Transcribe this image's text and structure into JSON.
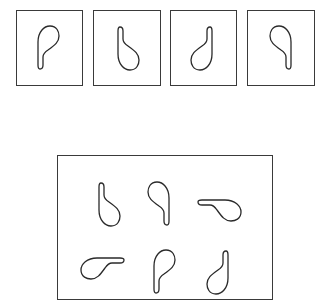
{
  "figure": {
    "type": "mental-rotation-puzzle",
    "reference_boxes": [
      {
        "id": "ref-1",
        "x": 16,
        "y": 10,
        "w": 67,
        "h": 76,
        "shape": {
          "cx": 47,
          "cy": 48,
          "rotate": 0,
          "mirror": false
        }
      },
      {
        "id": "ref-2",
        "x": 93,
        "y": 10,
        "w": 68,
        "h": 76,
        "shape": {
          "cx": 127,
          "cy": 48,
          "rotate": 180,
          "mirror": true
        }
      },
      {
        "id": "ref-3",
        "x": 170,
        "y": 10,
        "w": 67,
        "h": 76,
        "shape": {
          "cx": 203,
          "cy": 48,
          "rotate": 180,
          "mirror": false
        }
      },
      {
        "id": "ref-4",
        "x": 247,
        "y": 10,
        "w": 68,
        "h": 76,
        "shape": {
          "cx": 282,
          "cy": 48,
          "rotate": 0,
          "mirror": true
        }
      }
    ],
    "answer_box": {
      "x": 57,
      "y": 155,
      "w": 216,
      "h": 145
    },
    "answer_shapes": [
      {
        "id": "opt-1",
        "cx": 108,
        "cy": 204,
        "rotate": 180,
        "mirror": true
      },
      {
        "id": "opt-2",
        "cx": 160,
        "cy": 204,
        "rotate": 0,
        "mirror": true
      },
      {
        "id": "opt-3",
        "cx": 219,
        "cy": 209,
        "rotate": 90,
        "mirror": false
      },
      {
        "id": "opt-4",
        "cx": 103,
        "cy": 267,
        "rotate": 270,
        "mirror": true
      },
      {
        "id": "opt-5",
        "cx": 163,
        "cy": 272,
        "rotate": 0,
        "mirror": false
      },
      {
        "id": "opt-6",
        "cx": 219,
        "cy": 272,
        "rotate": 180,
        "mirror": false
      }
    ],
    "colors": {
      "stroke": "#2a2a2a",
      "frame": "#3a3a3a",
      "background": "#ffffff"
    }
  }
}
